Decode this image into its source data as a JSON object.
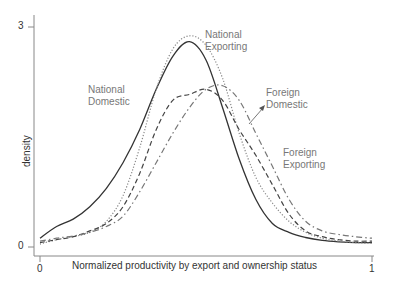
{
  "chart_data": {
    "type": "line",
    "title": "",
    "xlabel": "Normalized productivity by export and ownership status",
    "ylabel": "density",
    "xlim": [
      0,
      1
    ],
    "ylim": [
      0,
      3
    ],
    "xticks": [
      "0",
      "1"
    ],
    "yticks": [
      "0",
      "3"
    ],
    "grid": false,
    "legend": "inline labels",
    "x": [
      0.0,
      0.05,
      0.1,
      0.15,
      0.2,
      0.25,
      0.3,
      0.35,
      0.4,
      0.45,
      0.5,
      0.55,
      0.6,
      0.65,
      0.7,
      0.75,
      0.8,
      0.85,
      0.9,
      0.95,
      1.0
    ],
    "series": [
      {
        "name": "National Domestic",
        "style": "solid",
        "values": [
          0.12,
          0.28,
          0.38,
          0.55,
          0.8,
          1.15,
          1.6,
          2.15,
          2.6,
          2.8,
          2.55,
          1.9,
          1.2,
          0.65,
          0.32,
          0.2,
          0.13,
          0.09,
          0.07,
          0.06,
          0.06
        ]
      },
      {
        "name": "National Exporting",
        "style": "dotted",
        "values": [
          0.04,
          0.1,
          0.14,
          0.2,
          0.35,
          0.7,
          1.35,
          2.15,
          2.7,
          2.88,
          2.75,
          2.3,
          1.55,
          0.95,
          0.6,
          0.35,
          0.2,
          0.12,
          0.08,
          0.06,
          0.05
        ]
      },
      {
        "name": "Foreign Domestic",
        "style": "dashed",
        "values": [
          0.06,
          0.1,
          0.14,
          0.22,
          0.32,
          0.55,
          1.0,
          1.6,
          2.0,
          2.08,
          2.15,
          2.0,
          1.6,
          1.25,
          0.85,
          0.45,
          0.22,
          0.14,
          0.1,
          0.08,
          0.08
        ]
      },
      {
        "name": "Foreign Exporting",
        "style": "dash-dot",
        "values": [
          0.08,
          0.12,
          0.15,
          0.2,
          0.28,
          0.42,
          0.75,
          1.15,
          1.55,
          1.9,
          2.15,
          2.2,
          2.0,
          1.55,
          1.1,
          0.65,
          0.35,
          0.22,
          0.17,
          0.14,
          0.12
        ]
      }
    ],
    "annotations": [
      {
        "text": "National Domestic",
        "series": "National Domestic"
      },
      {
        "text": "National Exporting",
        "series": "National Exporting"
      },
      {
        "text": "Foreign Domestic",
        "series": "Foreign Domestic",
        "arrow": true
      },
      {
        "text": "Foreign Exporting",
        "series": "Foreign Exporting"
      }
    ]
  },
  "labels": {
    "national_domestic": [
      "National",
      "Domestic"
    ],
    "national_exporting": [
      "National",
      "Exporting"
    ],
    "foreign_domestic": [
      "Foreign",
      "Domestic"
    ],
    "foreign_exporting": [
      "Foreign",
      "Exporting"
    ]
  },
  "axes": {
    "ylabel": "density",
    "xlabel": "Normalized productivity by export and ownership status",
    "y_tick_top": "3",
    "y_tick_bottom": "0",
    "x_tick_left": "0",
    "x_tick_right": "1"
  },
  "colors": {
    "axis": "#888888",
    "national_domestic": "#333333",
    "national_exporting": "#888888",
    "foreign_domestic": "#444444",
    "foreign_exporting": "#777777",
    "label_text": "#777777"
  }
}
